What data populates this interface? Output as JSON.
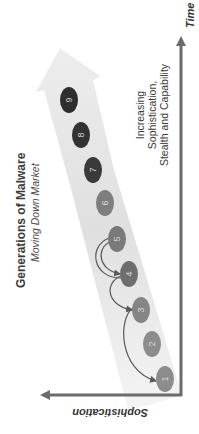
{
  "title": "Generations of Malware",
  "subtitle": "Moving Down Market",
  "description_lines": [
    "Increasing",
    "Sophistication,",
    "Stealth and Capability"
  ],
  "axes": {
    "x_label": "Time",
    "y_label": "Sophistication"
  },
  "generations": [
    {
      "label": "1",
      "cx": 165,
      "cy": 379,
      "fill": "#8c8c8c",
      "text_color": "#d8d8d8"
    },
    {
      "label": "2",
      "cx": 152,
      "cy": 344,
      "fill": "#8c8c8c",
      "text_color": "#d8d8d8"
    },
    {
      "label": "3",
      "cx": 141,
      "cy": 310,
      "fill": "#858585",
      "text_color": "#d8d8d8"
    },
    {
      "label": "4",
      "cx": 129,
      "cy": 274,
      "fill": "#6e6e6e",
      "text_color": "#d8d8d8"
    },
    {
      "label": "5",
      "cx": 117,
      "cy": 239,
      "fill": "#7a7a7a",
      "text_color": "#d8d8d8"
    },
    {
      "label": "6",
      "cx": 105,
      "cy": 203,
      "fill": "#7e7e7e",
      "text_color": "#d8d8d8"
    },
    {
      "label": "7",
      "cx": 93,
      "cy": 170,
      "fill": "#3a3a3a",
      "text_color": "#d0d0d0"
    },
    {
      "label": "8",
      "cx": 81,
      "cy": 135,
      "fill": "#333333",
      "text_color": "#d0d0d0"
    },
    {
      "label": "9",
      "cx": 69,
      "cy": 100,
      "fill": "#2e2e2e",
      "text_color": "#d0d0d0"
    }
  ],
  "connectors": [
    {
      "from": "3",
      "to": "1"
    },
    {
      "from": "4",
      "to": "3"
    },
    {
      "from": "5",
      "to": "4"
    }
  ],
  "colors": {
    "axis": "#6b6b6b",
    "band_light": "#f2f2f2",
    "band_dark": "#dcdcdc",
    "connector": "#5a5a5a"
  }
}
